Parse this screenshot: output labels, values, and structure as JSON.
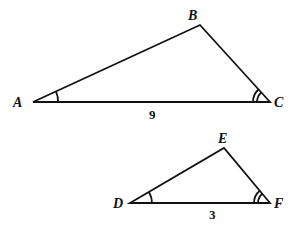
{
  "triangles": [
    {
      "vertices": {
        "A": "A",
        "B": "B",
        "C": "C"
      },
      "base_label": "9"
    },
    {
      "vertices": {
        "D": "D",
        "E": "E",
        "F": "F"
      },
      "base_label": "3"
    }
  ],
  "colors": {
    "stroke": "#111111",
    "background": "#ffffff"
  }
}
